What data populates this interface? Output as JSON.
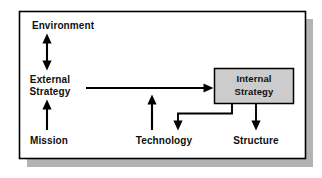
{
  "diagram": {
    "frame": {
      "border_color": "#000000",
      "fill_color": "#ffffff",
      "shadow_color": "#b3b3b3"
    },
    "nodes": {
      "environment": {
        "label": "Environment"
      },
      "external_strategy": {
        "label_line1": "External",
        "label_line2": "Strategy"
      },
      "mission": {
        "label": "Mission"
      },
      "technology": {
        "label": "Technology"
      },
      "structure": {
        "label": "Structure"
      },
      "internal_strategy": {
        "label_line1": "Internal",
        "label_line2": "Strategy",
        "fill_color": "#cccccc",
        "border_color": "#000000"
      }
    },
    "connectors": {
      "environment_external": {
        "name": "environment-external-strategy-arrow",
        "style": "double-headed-vertical"
      },
      "mission_external": {
        "name": "mission-external-strategy-arrow",
        "style": "single-headed-up"
      },
      "external_internal": {
        "name": "external-to-internal-strategy-arrow",
        "style": "single-headed-right"
      },
      "technology_external": {
        "name": "technology-to-external-arrow",
        "style": "single-headed-up"
      },
      "internal_technology": {
        "name": "internal-strategy-to-technology-elbow-arrow",
        "style": "elbow-down-left-down"
      },
      "internal_structure": {
        "name": "internal-strategy-to-structure-arrow",
        "style": "single-headed-down"
      }
    },
    "line_color": "#000000"
  }
}
